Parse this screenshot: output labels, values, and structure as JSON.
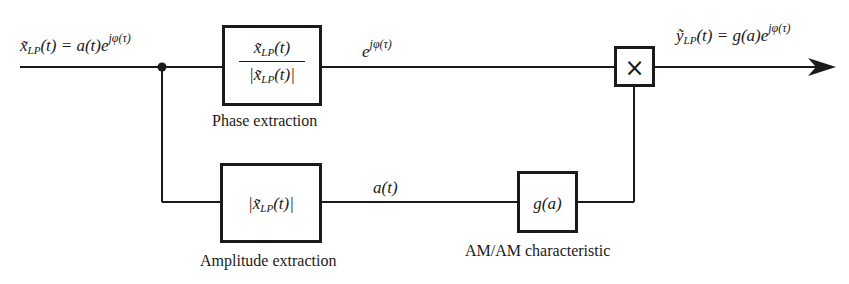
{
  "diagram": {
    "type": "block-diagram",
    "title": "",
    "input_signal": {
      "base": "x̃",
      "sub": "LP",
      "arg": "(t) = a(t)e",
      "sup": "jφ(τ)"
    },
    "phase_output_label": {
      "base": "e",
      "sup": "jφ(τ)"
    },
    "output_signal": {
      "base": "ỹ",
      "sub": "LP",
      "arg": "(t) = g(a)e",
      "sup": "jφ(τ)"
    },
    "amplitude_output_label": "a(t)",
    "blocks": {
      "phase": {
        "numerator_base": "x̃",
        "numerator_sub": "LP",
        "numerator_arg": "(t)",
        "denominator_base": "|x̃",
        "denominator_sub": "LP",
        "denominator_arg": "(t)|",
        "caption": "Phase extraction"
      },
      "amplitude": {
        "base": "|x̃",
        "sub": "LP",
        "arg": "(t)|",
        "caption": "Amplitude extraction"
      },
      "amam": {
        "label": "g(a)",
        "caption": "AM/AM characteristic"
      },
      "multiplier": {
        "symbol": "×"
      }
    },
    "colors": {
      "line": "#1a1a1a",
      "background": "#ffffff"
    }
  }
}
